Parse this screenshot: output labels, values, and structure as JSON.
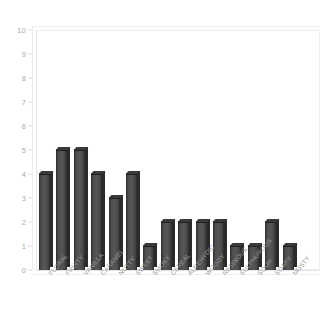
{
  "chart_data": {
    "type": "bar",
    "title": "",
    "subtitle": "",
    "xlabel": "",
    "ylabel": "",
    "categories": [
      "FLORAL",
      "FRUITY",
      "VANILLA",
      "CARAMEL",
      "NUTTY",
      "SWEET",
      "SMOKY",
      "CEREAL",
      "ALDEHYDIC",
      "WOODY",
      "RESINOUS",
      "SULPHUROUS",
      "SOUR",
      "SOAPY",
      "MUSTY"
    ],
    "values": [
      4,
      5,
      5,
      4,
      3,
      4,
      1,
      2,
      2,
      2,
      2,
      1,
      1,
      2,
      1
    ],
    "ylim": [
      0,
      10
    ],
    "ytick_labels": [
      "10",
      "9",
      "8",
      "7",
      "6",
      "5",
      "4",
      "3",
      "2",
      "1",
      "0"
    ],
    "ytick_values": [
      10,
      9,
      8,
      7,
      6,
      5,
      4,
      3,
      2,
      1,
      0
    ],
    "grid": false,
    "legend": null,
    "style": "3d-column",
    "bar_color": "#4a4a4a",
    "axis_text_color": "#a8a9ab",
    "frame_color": "#ececed",
    "background": "#ffffff"
  }
}
